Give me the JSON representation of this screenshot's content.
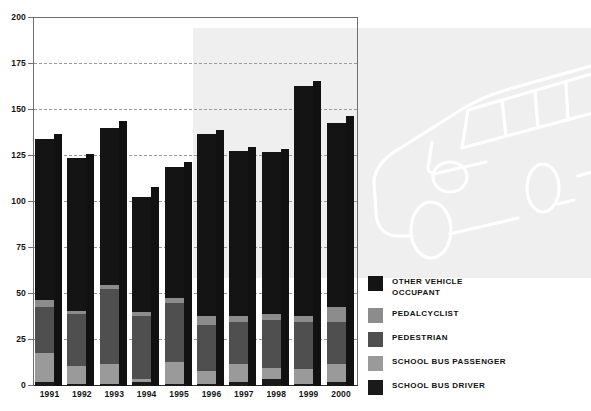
{
  "chart_data": {
    "type": "bar",
    "title": "",
    "xlabel": "",
    "ylabel": "",
    "ylim": [
      0,
      200
    ],
    "yticks": [
      0,
      25,
      50,
      75,
      100,
      125,
      150,
      175,
      200
    ],
    "grid": true,
    "legend_position": "right",
    "stacked": true,
    "categories": [
      "1991",
      "1992",
      "1993",
      "1994",
      "1995",
      "1996",
      "1997",
      "1998",
      "1999",
      "2000"
    ],
    "series": [
      {
        "name": "SCHOOL BUS DRIVER",
        "color": "#1a1a1a",
        "values": [
          2,
          1,
          1,
          2,
          1,
          1,
          2,
          4,
          1,
          2
        ]
      },
      {
        "name": "SCHOOL BUS PASSENGER",
        "color": "#9a9a9a",
        "values": [
          16,
          10,
          11,
          2,
          12,
          7,
          10,
          6,
          8,
          10
        ]
      },
      {
        "name": "PEDESTRIAN",
        "color": "#4f4f4f",
        "values": [
          25,
          28,
          41,
          34,
          32,
          25,
          23,
          26,
          26,
          23
        ]
      },
      {
        "name": "PEDALCYCLIST",
        "color": "#8c8c8c",
        "values": [
          4,
          2,
          2,
          2,
          3,
          5,
          3,
          3,
          3,
          8
        ]
      },
      {
        "name": "OTHER VEHICLE\nOCCUPANT",
        "color": "#141414",
        "values": [
          87,
          83,
          85,
          63,
          71,
          99,
          90,
          88,
          125,
          100
        ]
      }
    ],
    "totals": [
      137,
      126,
      144,
      108,
      122,
      139,
      130,
      129,
      166,
      147
    ],
    "total_bar_color": "#111111",
    "annotations": {
      "shaded_region_from": "1996",
      "background_illustration": "school-bus-line-art"
    }
  },
  "legend": {
    "items": [
      {
        "label": "OTHER VEHICLE\nOCCUPANT",
        "color": "#141414"
      },
      {
        "label": "PEDALCYCLIST",
        "color": "#8c8c8c"
      },
      {
        "label": "PEDESTRIAN",
        "color": "#4f4f4f"
      },
      {
        "label": "SCHOOL BUS PASSENGER",
        "color": "#9a9a9a"
      },
      {
        "label": "SCHOOL BUS DRIVER",
        "color": "#1a1a1a"
      }
    ]
  },
  "axis": {
    "y_tick_labels": [
      "200",
      "175",
      "150",
      "125",
      "100",
      "75",
      "50",
      "25",
      "0"
    ],
    "x_tick_labels": [
      "1991",
      "1992",
      "1993",
      "1994",
      "1995",
      "1996",
      "1997",
      "1998",
      "1999",
      "2000"
    ]
  },
  "colors": {
    "panel_bg": "#efefef",
    "page_bg": "#ffffff",
    "axis": "#6e6e6e",
    "gridline": "#9b9b9b",
    "text": "#141414"
  }
}
